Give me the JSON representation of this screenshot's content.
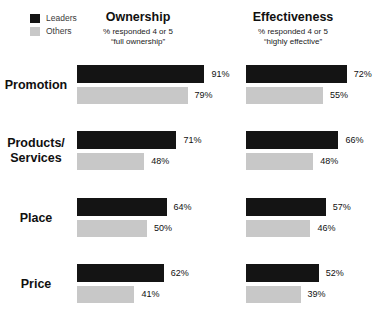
{
  "legend": {
    "items": [
      {
        "label": "Leaders",
        "color": "#141414"
      },
      {
        "label": "Others",
        "color": "#c8c8c8"
      }
    ]
  },
  "headers": [
    {
      "title": "Ownership",
      "subtitle_line1": "% responded 4 or 5",
      "subtitle_line2": "“full ownership”"
    },
    {
      "title": "Effectiveness",
      "subtitle_line1": "% responded 4 or 5",
      "subtitle_line2": "“highly effective”"
    }
  ],
  "chart_data": {
    "type": "bar",
    "orientation": "horizontal",
    "value_unit": "%",
    "axis_max": 100,
    "legend_position": "top-left",
    "grid": false,
    "series": [
      {
        "name": "Leaders",
        "color": "#141414"
      },
      {
        "name": "Others",
        "color": "#c8c8c8"
      }
    ],
    "categories": [
      "Promotion",
      "Products/Services",
      "Place",
      "Price"
    ],
    "category_label_lines": [
      [
        "Promotion"
      ],
      [
        "Products/",
        "Services"
      ],
      [
        "Place"
      ],
      [
        "Price"
      ]
    ],
    "groups": [
      {
        "title": "Ownership",
        "subtitle": "% responded 4 or 5 “full ownership”",
        "series": [
          {
            "name": "Leaders",
            "values": [
              91,
              71,
              64,
              62
            ]
          },
          {
            "name": "Others",
            "values": [
              79,
              48,
              50,
              41
            ]
          }
        ]
      },
      {
        "title": "Effectiveness",
        "subtitle": "% responded 4 or 5 “highly effective”",
        "series": [
          {
            "name": "Leaders",
            "values": [
              72,
              66,
              57,
              52
            ]
          },
          {
            "name": "Others",
            "values": [
              55,
              48,
              46,
              39
            ]
          }
        ]
      }
    ]
  }
}
